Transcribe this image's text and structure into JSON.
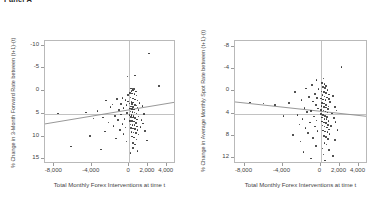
{
  "figure": {
    "title": "Panel A"
  },
  "panels": [
    {
      "id": "left",
      "ylabel": "% Change in 3-Month Forward Rate between (t+1)-(t)",
      "xlabel": "Total Monthly Forex Interventions at time t",
      "yticks": [
        "15",
        "10",
        "5",
        "0",
        "-5",
        "-10"
      ],
      "xticks": [
        "-8,000",
        "-4,000",
        "0",
        "2,000",
        "4,000"
      ]
    },
    {
      "id": "right",
      "ylabel": "% Change in Average Monthly Spot Rate between (t+1)-(t)",
      "xlabel": "Total Monthly Forex Interventions at time t",
      "yticks": [
        "12",
        "8",
        "4",
        "0",
        "-4",
        "-8"
      ],
      "xticks": [
        "-8,000",
        "-4,000",
        "0",
        "2,000",
        "4,000"
      ]
    }
  ],
  "chart_data": [
    {
      "type": "scatter",
      "title": "",
      "xlabel": "Total Monthly Forex Interventions at time t",
      "ylabel": "% Change in 3-Month Forward Rate between (t+1)-(t)",
      "xlim": [
        -9000,
        5000
      ],
      "ylim": [
        -11,
        16
      ],
      "xticks": [
        -8000,
        -4000,
        0,
        2000,
        4000
      ],
      "yticks": [
        -10,
        -5,
        0,
        5,
        10,
        15
      ],
      "grid": false,
      "legend": "none",
      "reference_lines": {
        "hline": 0,
        "vline": 0
      },
      "fit_line": {
        "x": [
          -9000,
          5000
        ],
        "y": [
          -2.2,
          2.6
        ],
        "slope_sign": "positive"
      },
      "points": [
        [
          2100,
          13.3
        ],
        [
          -200,
          8.2
        ],
        [
          600,
          8.4
        ],
        [
          3200,
          6.1
        ],
        [
          200,
          5.6
        ],
        [
          350,
          5.5
        ],
        [
          500,
          5.4
        ],
        [
          250,
          5.0
        ],
        [
          420,
          5.1
        ],
        [
          700,
          4.9
        ],
        [
          100,
          4.6
        ],
        [
          300,
          4.5
        ],
        [
          560,
          4.4
        ],
        [
          -150,
          4.2
        ],
        [
          800,
          4.0
        ],
        [
          -700,
          3.5
        ],
        [
          -1300,
          3.3
        ],
        [
          -2500,
          2.9
        ],
        [
          150,
          3.6
        ],
        [
          380,
          3.4
        ],
        [
          620,
          3.2
        ],
        [
          -400,
          3.0
        ],
        [
          900,
          2.9
        ],
        [
          -100,
          2.7
        ],
        [
          260,
          2.6
        ],
        [
          430,
          2.5
        ],
        [
          1100,
          2.4
        ],
        [
          -850,
          2.2
        ],
        [
          -1800,
          2.1
        ],
        [
          50,
          2.3
        ],
        [
          320,
          2.2
        ],
        [
          600,
          2.0
        ],
        [
          -300,
          1.9
        ],
        [
          780,
          1.8
        ],
        [
          1400,
          1.7
        ],
        [
          -2000,
          1.5
        ],
        [
          180,
          1.6
        ],
        [
          400,
          1.5
        ],
        [
          900,
          1.4
        ],
        [
          -600,
          1.3
        ],
        [
          60,
          1.2
        ],
        [
          280,
          1.1
        ],
        [
          520,
          1.0
        ],
        [
          -1100,
          0.9
        ],
        [
          1000,
          0.8
        ],
        [
          -3400,
          0.6
        ],
        [
          -4600,
          0.3
        ],
        [
          -7600,
          0.1
        ],
        [
          120,
          0.5
        ],
        [
          340,
          0.4
        ],
        [
          560,
          0.3
        ],
        [
          -250,
          0.2
        ],
        [
          760,
          0.1
        ],
        [
          1600,
          0.0
        ],
        [
          -900,
          -0.1
        ],
        [
          20,
          -0.2
        ],
        [
          240,
          -0.3
        ],
        [
          460,
          -0.4
        ],
        [
          -1500,
          -0.5
        ],
        [
          980,
          -0.6
        ],
        [
          -2800,
          -0.8
        ],
        [
          -3800,
          -1.0
        ],
        [
          160,
          -0.7
        ],
        [
          380,
          -0.8
        ],
        [
          600,
          -0.9
        ],
        [
          -500,
          -1.1
        ],
        [
          820,
          -1.2
        ],
        [
          1300,
          -1.3
        ],
        [
          -1200,
          -1.4
        ],
        [
          80,
          -1.5
        ],
        [
          300,
          -1.6
        ],
        [
          520,
          -1.7
        ],
        [
          -2200,
          -1.9
        ],
        [
          740,
          -2.0
        ],
        [
          1500,
          -2.1
        ],
        [
          -700,
          -2.2
        ],
        [
          140,
          -2.3
        ],
        [
          360,
          -2.4
        ],
        [
          580,
          -2.5
        ],
        [
          -1700,
          -2.7
        ],
        [
          860,
          -2.8
        ],
        [
          1200,
          -2.9
        ],
        [
          -400,
          -3.0
        ],
        [
          200,
          -3.1
        ],
        [
          420,
          -3.2
        ],
        [
          640,
          -3.3
        ],
        [
          -1000,
          -3.5
        ],
        [
          900,
          -3.6
        ],
        [
          1700,
          -3.7
        ],
        [
          -2600,
          -3.9
        ],
        [
          260,
          -4.0
        ],
        [
          480,
          -4.1
        ],
        [
          700,
          -4.2
        ],
        [
          -600,
          -4.4
        ],
        [
          1000,
          -4.5
        ],
        [
          -4200,
          -4.8
        ],
        [
          320,
          -5.0
        ],
        [
          540,
          -5.2
        ],
        [
          -1400,
          -5.4
        ],
        [
          760,
          -5.6
        ],
        [
          1900,
          -5.8
        ],
        [
          -300,
          -6.1
        ],
        [
          380,
          -6.4
        ],
        [
          600,
          -6.7
        ],
        [
          -6200,
          -7.2
        ],
        [
          -3000,
          -7.8
        ],
        [
          430,
          -7.5
        ],
        [
          900,
          -8.1
        ],
        [
          120,
          -8.6
        ]
      ]
    },
    {
      "type": "scatter",
      "title": "",
      "xlabel": "Total Monthly Forex Interventions at time t",
      "ylabel": "% Change in Average Monthly Spot Rate between (t+1)-(t)",
      "xlim": [
        -9000,
        5000
      ],
      "ylim": [
        -9,
        13
      ],
      "xticks": [
        -8000,
        -4000,
        0,
        2000,
        4000
      ],
      "yticks": [
        -8,
        -4,
        0,
        4,
        8,
        12
      ],
      "grid": false,
      "legend": "none",
      "reference_lines": {
        "hline": 0,
        "vline": 0
      },
      "fit_line": {
        "x": [
          -9000,
          5000
        ],
        "y": [
          2.1,
          -0.5
        ],
        "slope_sign": "negative"
      },
      "points": [
        [
          2200,
          8.3
        ],
        [
          -400,
          6.0
        ],
        [
          300,
          6.3
        ],
        [
          -900,
          5.1
        ],
        [
          150,
          5.5
        ],
        [
          420,
          5.3
        ],
        [
          600,
          5.0
        ],
        [
          -1500,
          4.5
        ],
        [
          250,
          4.8
        ],
        [
          500,
          4.6
        ],
        [
          -200,
          4.4
        ],
        [
          750,
          4.2
        ],
        [
          -2700,
          3.9
        ],
        [
          100,
          4.0
        ],
        [
          350,
          3.9
        ],
        [
          580,
          3.7
        ],
        [
          -600,
          3.5
        ],
        [
          880,
          3.4
        ],
        [
          1300,
          3.2
        ],
        [
          -1200,
          3.0
        ],
        [
          200,
          3.3
        ],
        [
          430,
          3.1
        ],
        [
          660,
          2.9
        ],
        [
          -350,
          2.8
        ],
        [
          900,
          2.6
        ],
        [
          -2000,
          2.4
        ],
        [
          60,
          2.7
        ],
        [
          290,
          2.5
        ],
        [
          520,
          2.4
        ],
        [
          -800,
          2.2
        ],
        [
          1000,
          2.1
        ],
        [
          -3300,
          1.9
        ],
        [
          -7400,
          2.0
        ],
        [
          -6000,
          1.8
        ],
        [
          -4800,
          1.6
        ],
        [
          160,
          1.9
        ],
        [
          390,
          1.8
        ],
        [
          610,
          1.6
        ],
        [
          -500,
          1.5
        ],
        [
          830,
          1.3
        ],
        [
          1500,
          1.2
        ],
        [
          -1700,
          1.0
        ],
        [
          120,
          1.4
        ],
        [
          340,
          1.2
        ],
        [
          560,
          1.1
        ],
        [
          -250,
          0.9
        ],
        [
          780,
          0.8
        ],
        [
          1700,
          0.6
        ],
        [
          -1000,
          0.5
        ],
        [
          80,
          0.7
        ],
        [
          300,
          0.6
        ],
        [
          520,
          0.4
        ],
        [
          -1400,
          0.3
        ],
        [
          740,
          0.2
        ],
        [
          1200,
          0.0
        ],
        [
          -2400,
          -0.2
        ],
        [
          -3900,
          -0.4
        ],
        [
          40,
          -0.1
        ],
        [
          260,
          -0.2
        ],
        [
          480,
          -0.4
        ],
        [
          -700,
          -0.5
        ],
        [
          700,
          -0.6
        ],
        [
          1400,
          -0.8
        ],
        [
          -1900,
          -0.9
        ],
        [
          180,
          -0.7
        ],
        [
          400,
          -0.9
        ],
        [
          620,
          -1.0
        ],
        [
          -400,
          -1.2
        ],
        [
          840,
          -1.3
        ],
        [
          1600,
          -1.5
        ],
        [
          -1100,
          -1.6
        ],
        [
          140,
          -1.4
        ],
        [
          360,
          -1.6
        ],
        [
          580,
          -1.7
        ],
        [
          -2200,
          -1.9
        ],
        [
          800,
          -2.0
        ],
        [
          1100,
          -2.2
        ],
        [
          -600,
          -2.3
        ],
        [
          220,
          -2.1
        ],
        [
          440,
          -2.3
        ],
        [
          660,
          -2.5
        ],
        [
          -1600,
          -2.6
        ],
        [
          880,
          -2.8
        ],
        [
          1800,
          -2.9
        ],
        [
          -300,
          -3.1
        ],
        [
          280,
          -3.0
        ],
        [
          500,
          -3.2
        ],
        [
          720,
          -3.3
        ],
        [
          -1300,
          -3.5
        ],
        [
          940,
          -3.6
        ],
        [
          -2900,
          -3.8
        ],
        [
          340,
          -4.0
        ],
        [
          560,
          -4.2
        ],
        [
          -800,
          -4.3
        ],
        [
          780,
          -4.5
        ],
        [
          1500,
          -4.7
        ],
        [
          -2100,
          -5.0
        ],
        [
          400,
          -5.2
        ],
        [
          620,
          -5.5
        ],
        [
          -500,
          -5.8
        ],
        [
          200,
          -6.2
        ],
        [
          900,
          -6.5
        ],
        [
          -1800,
          -6.9
        ],
        [
          300,
          -7.3
        ],
        [
          1300,
          -7.6
        ],
        [
          -1000,
          -8.0
        ],
        [
          500,
          -8.4
        ]
      ]
    }
  ]
}
